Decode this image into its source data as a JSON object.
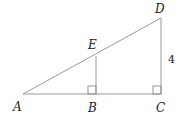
{
  "diagram": {
    "type": "geometry",
    "points": {
      "A": {
        "label": "A",
        "x": 23,
        "y": 94
      },
      "B": {
        "label": "B",
        "x": 96,
        "y": 94
      },
      "C": {
        "label": "C",
        "x": 161,
        "y": 94
      },
      "D": {
        "label": "D",
        "x": 161,
        "y": 18
      },
      "E": {
        "label": "E",
        "x": 96,
        "y": 56
      }
    },
    "segments": [
      "AC",
      "AD",
      "DC",
      "EB"
    ],
    "right_angles": [
      "B",
      "C"
    ],
    "measurements": [
      {
        "segment": "DC",
        "label": "4"
      }
    ]
  }
}
